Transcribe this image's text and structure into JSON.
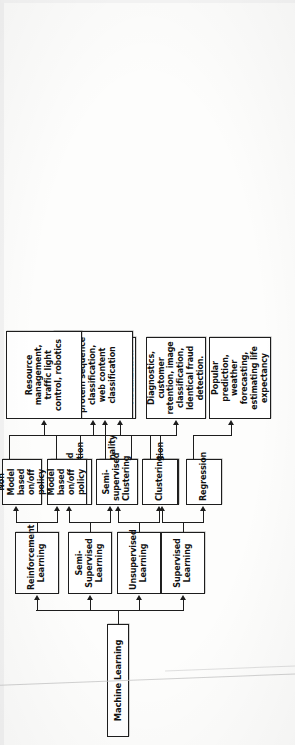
{
  "diagram": {
    "type": "flowchart",
    "orientation": "rotated-90-clockwise-on-page",
    "root": {
      "id": "machine-learning",
      "label": "Machine Learning"
    },
    "colors": {
      "stroke": "#1d1d1d",
      "box_fill": "#ffffff",
      "text": "#111111",
      "page": "#fdfdfc"
    },
    "branches": [
      {
        "id": "supervised-learning",
        "label": "Supervised Learning",
        "methods": [
          {
            "id": "classification",
            "label": "Classification"
          },
          {
            "id": "regression",
            "label": "Regression"
          }
        ],
        "outcomes": [
          {
            "id": "supervised-outcome-classification",
            "label": "Diagnostics, customer retention, image classification, Identical fraud detection.",
            "from": "classification"
          },
          {
            "id": "supervised-outcome-regression",
            "label": "Popular prediction, weather forecasting, estimating life expectancy",
            "from": "regression"
          }
        ]
      },
      {
        "id": "unsupervised-learning",
        "label": "Unsupervised Learning",
        "methods": [
          {
            "id": "dimensionality-reduction",
            "label": "Dimensionality reduction"
          },
          {
            "id": "clustering",
            "label": "Clustering"
          }
        ],
        "outcomes": [
          {
            "id": "unsupervised-outcome-dimensionality",
            "label": "Structure discovery, meaningful Compression, Big data Visualization",
            "from": "dimensionality-reduction"
          },
          {
            "id": "unsupervised-outcome-clustering",
            "label": "Customer segmentation, targeted marketing",
            "from": "clustering"
          }
        ]
      },
      {
        "id": "semi-supervised-learning",
        "label": "Semi-Supervised Learning",
        "methods": [
          {
            "id": "semi-supervised-classification",
            "label": "Semi-supervised Classification"
          },
          {
            "id": "semi-supervised-clustering",
            "label": "Semi-supervised Clustering"
          }
        ],
        "outcomes": [
          {
            "id": "semi-supervised-outcome",
            "label": "Speech analysis, protein sequence classification, web content classification",
            "from": "both"
          }
        ]
      },
      {
        "id": "reinforcement-learning",
        "label": "Reinforcement Learning",
        "methods": [
          {
            "id": "non-model-based-policy",
            "label": "Non Model based on/off policy"
          },
          {
            "id": "model-based-policy",
            "label": "Model based on/off policy"
          }
        ],
        "outcomes": [
          {
            "id": "reinforcement-outcome",
            "label": "Resource management, traffic light control, robotics",
            "from": "both"
          }
        ]
      }
    ]
  }
}
